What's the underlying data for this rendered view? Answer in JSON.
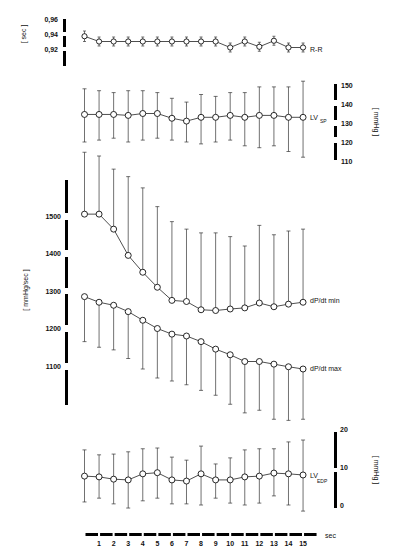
{
  "chart_data": [
    {
      "type": "line",
      "name": "R-R",
      "label": "R-R",
      "unit": "sec",
      "x": [
        0,
        1,
        2,
        3,
        4,
        5,
        6,
        7,
        8,
        9,
        10,
        11,
        12,
        13,
        14,
        15
      ],
      "values": [
        0.937,
        0.93,
        0.93,
        0.93,
        0.93,
        0.93,
        0.93,
        0.93,
        0.93,
        0.93,
        0.922,
        0.93,
        0.923,
        0.931,
        0.922,
        0.922
      ],
      "err_upper": [
        0.944,
        0.936,
        0.936,
        0.936,
        0.936,
        0.936,
        0.936,
        0.936,
        0.936,
        0.936,
        0.928,
        0.936,
        0.929,
        0.937,
        0.928,
        0.928
      ],
      "err_lower": [
        0.93,
        0.924,
        0.924,
        0.924,
        0.924,
        0.924,
        0.924,
        0.924,
        0.924,
        0.924,
        0.916,
        0.924,
        0.917,
        0.925,
        0.916,
        0.916
      ],
      "yticks": [
        "0,96",
        "0,94",
        "0,92"
      ],
      "ytick_values": [
        0.96,
        0.94,
        0.92
      ],
      "ylim": [
        0.91,
        0.97
      ]
    },
    {
      "type": "line",
      "name": "LV_SP",
      "label": "LV",
      "label_sub": "SP",
      "unit": "mmHg",
      "x": [
        0,
        1,
        2,
        3,
        4,
        5,
        6,
        7,
        8,
        9,
        10,
        11,
        12,
        13,
        14,
        15
      ],
      "values": [
        134.5,
        134.5,
        134.5,
        134,
        135,
        135,
        132.5,
        131,
        133,
        133,
        134,
        133,
        134,
        134,
        133,
        133
      ],
      "err_upper": [
        148,
        147,
        146,
        147,
        147,
        146,
        143,
        141,
        145,
        144,
        146,
        146,
        149,
        149,
        149,
        152
      ],
      "err_lower": [
        120,
        121,
        122,
        120,
        121,
        122,
        121,
        120,
        119,
        120,
        121,
        118,
        117,
        118,
        115,
        112
      ],
      "yticks": [
        "150",
        "140",
        "130",
        "120",
        "110"
      ],
      "ytick_values": [
        150,
        140,
        130,
        120,
        110
      ],
      "ylim": [
        108,
        152
      ]
    },
    {
      "type": "line",
      "name": "dP/dt min",
      "label": "dP/dt min",
      "unit": "mmHg/sec",
      "x": [
        0,
        1,
        2,
        3,
        4,
        5,
        6,
        7,
        8,
        9,
        10,
        11,
        12,
        13,
        14,
        15
      ],
      "values": [
        1505,
        1505,
        1465,
        1395,
        1350,
        1310,
        1275,
        1272,
        1250,
        1248,
        1252,
        1255,
        1268,
        1258,
        1265,
        1270
      ],
      "err_upper": [
        1670,
        1660,
        1625,
        1605,
        1575,
        1525,
        1485,
        1465,
        1455,
        1455,
        1445,
        1420,
        1475,
        1450,
        1460,
        1465
      ],
      "yticks": [
        "1500",
        "1400",
        "1300",
        "1200",
        "1100"
      ],
      "ytick_values": [
        1500,
        1400,
        1300,
        1200,
        1100
      ],
      "ylim": [
        920,
        1700
      ]
    },
    {
      "type": "line",
      "name": "dP/dt max",
      "label": "dP/dt max",
      "unit": "mmHg/sec",
      "x": [
        0,
        1,
        2,
        3,
        4,
        5,
        6,
        7,
        8,
        9,
        10,
        11,
        12,
        13,
        14,
        15
      ],
      "values": [
        1285,
        1270,
        1262,
        1245,
        1222,
        1200,
        1185,
        1180,
        1165,
        1145,
        1130,
        1112,
        1112,
        1105,
        1098,
        1092
      ],
      "err_lower": [
        1165,
        1150,
        1143,
        1120,
        1092,
        1068,
        1060,
        1050,
        1035,
        1022,
        998,
        975,
        982,
        958,
        955,
        958
      ]
    },
    {
      "type": "line",
      "name": "LV_EDP",
      "label": "LV",
      "label_sub": "EDP",
      "unit": "mmHg",
      "x": [
        0,
        1,
        2,
        3,
        4,
        5,
        6,
        7,
        8,
        9,
        10,
        11,
        12,
        13,
        14,
        15
      ],
      "values": [
        7.6,
        7.4,
        6.8,
        6.6,
        8.2,
        8.5,
        6.6,
        6.3,
        8.2,
        6.6,
        6.6,
        7.4,
        7.6,
        8.4,
        8.2,
        7.9
      ],
      "err_upper": [
        14.5,
        13.2,
        13.4,
        14,
        14.8,
        15,
        12.6,
        11.8,
        15.5,
        10.8,
        12.4,
        14.5,
        14.8,
        14.8,
        16.6,
        17.1
      ],
      "err_lower": [
        0.8,
        1.8,
        0.3,
        -0.8,
        1.1,
        1.8,
        0.3,
        0.3,
        0,
        1.8,
        0.5,
        0,
        0.5,
        2.4,
        0,
        -1.6
      ],
      "yticks": [
        "20",
        "10",
        "0"
      ],
      "ytick_values": [
        20,
        10,
        0
      ],
      "ylim": [
        -2,
        20
      ]
    }
  ],
  "xaxis": {
    "label": "sec",
    "ticks": [
      "1",
      "2",
      "3",
      "4",
      "5",
      "6",
      "7",
      "8",
      "9",
      "10",
      "11",
      "12",
      "13",
      "14",
      "15"
    ]
  },
  "units": {
    "rr": "sec",
    "lvsp": "mmHg",
    "dpdt": "mmHg/sec",
    "lvedp": "mmHg"
  }
}
